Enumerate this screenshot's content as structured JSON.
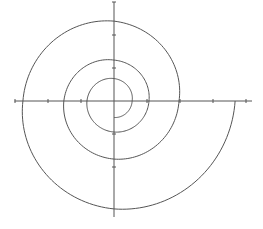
{
  "chart_data": {
    "type": "line",
    "title": "",
    "xlabel": "",
    "ylabel": "",
    "grid": false,
    "legend": null,
    "origin_px": [
      114,
      101
    ],
    "unit_px": 33,
    "xlim": [
      -3,
      4
    ],
    "ylim": [
      -3,
      3
    ],
    "x_ticks": [
      -3,
      -2,
      -1,
      1,
      2,
      3,
      4
    ],
    "y_ticks": [
      -2,
      -1,
      1,
      2,
      3
    ],
    "series": [
      {
        "name": "spiral",
        "color": "#555555",
        "start_angle_deg": -90,
        "direction": "counterclockwise",
        "quarter_turn_radii_units": [
          0.5,
          0.55,
          0.68,
          0.82,
          0.94,
          1.06,
          1.24,
          1.52,
          1.76,
          1.97,
          2.42,
          2.76,
          3.27,
          3.67
        ]
      }
    ]
  },
  "colors": {
    "axis": "#555555",
    "curve": "#555555",
    "background": "#ffffff"
  }
}
